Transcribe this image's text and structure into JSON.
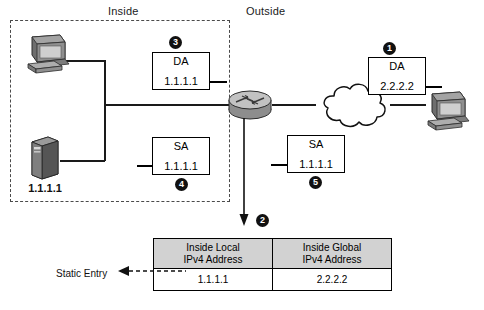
{
  "diagram": {
    "zones": {
      "inside_label": "Inside",
      "outside_label": "Outside"
    },
    "devices": {
      "inside_pc": {
        "icon": "desktop-computer-icon",
        "label": ""
      },
      "inside_server": {
        "icon": "server-tower-icon",
        "label": "1.1.1.1"
      },
      "router": {
        "icon": "router-icon",
        "label": ""
      },
      "cloud": {
        "icon": "network-cloud-icon",
        "label": ""
      },
      "outside_pc": {
        "icon": "desktop-computer-icon",
        "label": ""
      }
    },
    "packets": [
      {
        "id": "pkt-outside-da",
        "badge": "1",
        "type": "DA",
        "address": "2.2.2.2"
      },
      {
        "id": "pkt-inside-da",
        "badge": "3",
        "type": "DA",
        "address": "1.1.1.1"
      },
      {
        "id": "pkt-inside-sa",
        "badge": "4",
        "type": "SA",
        "address": "1.1.1.1"
      },
      {
        "id": "pkt-outside-sa",
        "badge": "5",
        "type": "SA",
        "address": "1.1.1.1"
      }
    ],
    "table": {
      "badge": "2",
      "headers": [
        "Inside Local\nIPv4 Address",
        "Inside Global\nIPv4 Address"
      ],
      "header_local_line1": "Inside Local",
      "header_local_line2": "IPv4 Address",
      "header_global_line1": "Inside Global",
      "header_global_line2": "IPv4 Address",
      "rows": [
        {
          "local": "1.1.1.1",
          "global": "2.2.2.2"
        }
      ],
      "annotation": "Static Entry"
    },
    "colors": {
      "ink": "#111111",
      "badge_fill": "#111111",
      "badge_text": "#ffffff",
      "table_header_fill": "#d2d2d2",
      "device_gray": "#8c8c8c",
      "dashed_boundary": "#4a4a4a"
    }
  }
}
